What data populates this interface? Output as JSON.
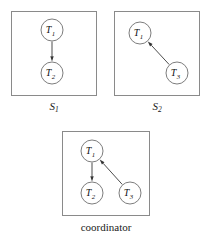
{
  "figure": {
    "width": 211,
    "height": 242,
    "background": "#ffffff",
    "border_color": "#8a8a8a",
    "node_stroke_color": "#7d7d7d",
    "edge_color": "#4d4d4d",
    "label_color": "#111111"
  },
  "panels": [
    {
      "id": "s1",
      "caption": "S",
      "caption_sub": "1",
      "caption_style": "italic",
      "box": {
        "x": 11,
        "y": 11,
        "width": 86,
        "height": 85
      },
      "nodes": [
        {
          "id": "t1",
          "label": "T",
          "sub": "1",
          "cx": 52,
          "cy": 30,
          "r": 11
        },
        {
          "id": "t2",
          "label": "T",
          "sub": "2",
          "cx": 52,
          "cy": 73,
          "r": 11
        }
      ],
      "edges": [
        {
          "from": "t1",
          "to": "t2",
          "arrow": "to"
        }
      ]
    },
    {
      "id": "s2",
      "caption": "S",
      "caption_sub": "2",
      "caption_style": "italic",
      "box": {
        "x": 114,
        "y": 11,
        "width": 86,
        "height": 85
      },
      "nodes": [
        {
          "id": "t1",
          "label": "T",
          "sub": "1",
          "cx": 140,
          "cy": 33,
          "r": 11
        },
        {
          "id": "t3",
          "label": "T",
          "sub": "3",
          "cx": 177,
          "cy": 73,
          "r": 11
        }
      ],
      "edges": [
        {
          "from": "t3",
          "to": "t1",
          "arrow": "to"
        }
      ]
    },
    {
      "id": "coordinator",
      "caption": "coordinator",
      "caption_sub": "",
      "caption_style": "plain",
      "box": {
        "x": 62,
        "y": 131,
        "width": 88,
        "height": 85
      },
      "nodes": [
        {
          "id": "t1",
          "label": "T",
          "sub": "1",
          "cx": 92,
          "cy": 151,
          "r": 11
        },
        {
          "id": "t2",
          "label": "T",
          "sub": "2",
          "cx": 92,
          "cy": 193,
          "r": 11
        },
        {
          "id": "t3",
          "label": "T",
          "sub": "3",
          "cx": 130,
          "cy": 193,
          "r": 11
        }
      ],
      "edges": [
        {
          "from": "t1",
          "to": "t2",
          "arrow": "to"
        },
        {
          "from": "t3",
          "to": "t1",
          "arrow": "to"
        }
      ]
    }
  ],
  "captions": [
    {
      "id": "s1-caption",
      "text": "S",
      "sub": "1",
      "cx": 54,
      "y": 101
    },
    {
      "id": "s2-caption",
      "text": "S",
      "sub": "2",
      "cx": 157,
      "y": 101
    },
    {
      "id": "coordinator-caption",
      "text": "coordinator",
      "sub": "",
      "cx": 106,
      "y": 222
    }
  ],
  "chart_data": {
    "type": "diagram",
    "title": "",
    "graphs": [
      {
        "name": "S1",
        "nodes": [
          "T1",
          "T2"
        ],
        "edges": [
          [
            "T1",
            "T2"
          ]
        ]
      },
      {
        "name": "S2",
        "nodes": [
          "T1",
          "T3"
        ],
        "edges": [
          [
            "T3",
            "T1"
          ]
        ]
      },
      {
        "name": "coordinator",
        "nodes": [
          "T1",
          "T2",
          "T3"
        ],
        "edges": [
          [
            "T1",
            "T2"
          ],
          [
            "T3",
            "T1"
          ]
        ]
      }
    ]
  }
}
